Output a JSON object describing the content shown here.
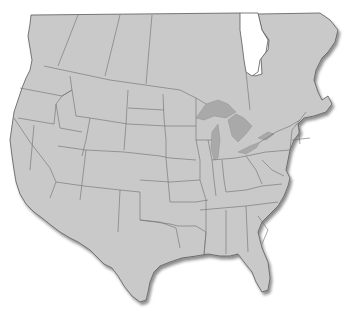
{
  "map": {
    "title": "",
    "region": "North America (United States and southern Canada)",
    "style": "grayscale political outline map",
    "colors": {
      "background": "#ffffff",
      "land": "#c9c9c9",
      "borders": "#6e6e6e",
      "coastline": "#5a5a5a",
      "lakes": "#a9a9a9",
      "shadow": "#9a9a9a"
    },
    "features": [
      "state boundaries",
      "province boundaries",
      "Great Lakes",
      "Hudson Bay (partial)",
      "Gulf of Mexico coastline",
      "Florida peninsula"
    ],
    "labels": []
  }
}
